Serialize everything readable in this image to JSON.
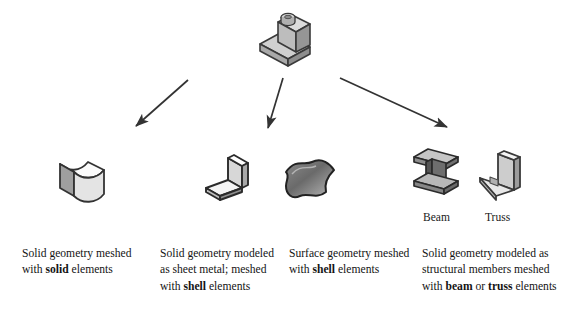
{
  "figure": {
    "type": "flow-diagram",
    "orientation": "top-down-fan",
    "background_color": "#ffffff",
    "arrow_color": "#333333"
  },
  "root": {
    "icon_name": "solid-cad-part-icon",
    "description": "3D stepped L-shaped solid CAD part",
    "colors": {
      "top_face": "#d9d9d9",
      "left_face": "#b3b3b3",
      "right_face": "#9a9a9a",
      "outline": "#3a3a3a"
    }
  },
  "arrows": [
    {
      "name": "arrow-to-solid",
      "x1": 188,
      "y1": 80,
      "x2": 133,
      "y2": 129,
      "color": "#333333"
    },
    {
      "name": "arrow-to-shell-surface",
      "x1": 283,
      "y1": 78,
      "x2": 267,
      "y2": 131,
      "color": "#333333"
    },
    {
      "name": "arrow-to-structural",
      "x1": 340,
      "y1": 78,
      "x2": 450,
      "y2": 130,
      "color": "#333333"
    }
  ],
  "icons": [
    {
      "name": "solid-block-icon",
      "description": "Solid block with curved top face",
      "colors": {
        "top_face": "#fafafa",
        "left_face": "#9f9f9f",
        "right_face": "#e2e2e2",
        "outline": "#333333"
      }
    },
    {
      "name": "sheet-metal-bend-icon",
      "description": "Bent sheet metal flange part",
      "colors": {
        "top_face": "#ffffff",
        "left_face": "#cfcfcf",
        "right_face": "#a8a8a8",
        "outline": "#2b2b2b"
      }
    },
    {
      "name": "surface-patch-icon",
      "description": "Curved wavy surface patch",
      "colors": {
        "fill_dark": "#6b6b6b",
        "fill_light": "#b5b5b5",
        "outline": "#222222"
      }
    },
    {
      "name": "i-beam-icon",
      "description": "Structural I-beam member",
      "colors": {
        "top_face": "#bdbdbd",
        "web_face": "#555555",
        "side_face": "#8a8a8a",
        "outline": "#2b2b2b"
      }
    },
    {
      "name": "c-channel-truss-icon",
      "description": "Structural C-channel / truss member",
      "colors": {
        "top_face": "#f2f2f2",
        "left_face": "#c2c2c2",
        "right_face": "#9c9c9c",
        "outline": "#3a3a3a"
      }
    }
  ],
  "labels": {
    "beam": "Beam",
    "truss": "Truss"
  },
  "captions": [
    {
      "name": "caption-solid",
      "parts": [
        {
          "text": "Solid geometry meshed with ",
          "bold": false
        },
        {
          "text": "solid",
          "bold": true
        },
        {
          "text": " elements",
          "bold": false
        }
      ]
    },
    {
      "name": "caption-sheet-metal",
      "parts": [
        {
          "text": "Solid geometry modeled as sheet metal; meshed with ",
          "bold": false
        },
        {
          "text": "shell",
          "bold": true
        },
        {
          "text": " elements",
          "bold": false
        }
      ]
    },
    {
      "name": "caption-surface",
      "parts": [
        {
          "text": "Surface geometry meshed with ",
          "bold": false
        },
        {
          "text": "shell",
          "bold": true
        },
        {
          "text": " elements",
          "bold": false
        }
      ]
    },
    {
      "name": "caption-structural",
      "parts": [
        {
          "text": "Solid geometry modeled as structural members meshed with ",
          "bold": false
        },
        {
          "text": "beam",
          "bold": true
        },
        {
          "text": " or ",
          "bold": false
        },
        {
          "text": "truss",
          "bold": true
        },
        {
          "text": " elements",
          "bold": false
        }
      ]
    }
  ]
}
